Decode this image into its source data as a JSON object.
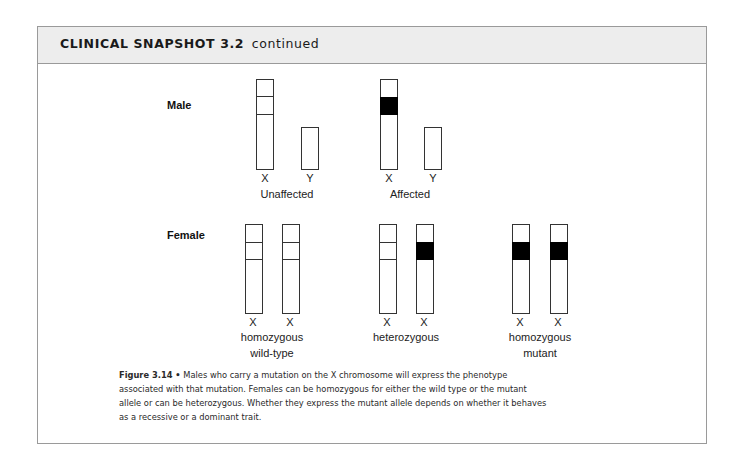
{
  "header": {
    "title_bold": "CLINICAL SNAPSHOT 3.2",
    "title_suffix": "continued"
  },
  "figure": {
    "male": {
      "row_label": "Male",
      "groups": [
        {
          "label": "Unaffected",
          "chromosomes": [
            {
              "name": "X",
              "band": "wild-type"
            },
            {
              "name": "Y",
              "band": "none"
            }
          ]
        },
        {
          "label": "Affected",
          "chromosomes": [
            {
              "name": "X",
              "band": "mutant"
            },
            {
              "name": "Y",
              "band": "none"
            }
          ]
        }
      ]
    },
    "female": {
      "row_label": "Female",
      "groups": [
        {
          "label_line1": "homozygous",
          "label_line2": "wild-type",
          "chromosomes": [
            {
              "name": "X",
              "band": "wild-type"
            },
            {
              "name": "X",
              "band": "wild-type"
            }
          ]
        },
        {
          "label_line1": "heterozygous",
          "label_line2": "",
          "chromosomes": [
            {
              "name": "X",
              "band": "wild-type"
            },
            {
              "name": "X",
              "band": "mutant"
            }
          ]
        },
        {
          "label_line1": "homozygous",
          "label_line2": "mutant",
          "chromosomes": [
            {
              "name": "X",
              "band": "mutant"
            },
            {
              "name": "X",
              "band": "mutant"
            }
          ]
        }
      ]
    },
    "colors": {
      "mutant_band": "#000000",
      "outline": "#333333",
      "header_bg": "#ededed"
    }
  },
  "caption": {
    "label": "Figure 3.14 •",
    "text": "Males who carry a mutation on the X chromosome will express the phenotype associated with that mutation. Females can be homozygous for either the wild type or the mutant allele or can be heterozygous. Whether they express the mutant allele depends on whether it behaves as a recessive or a dominant trait."
  }
}
